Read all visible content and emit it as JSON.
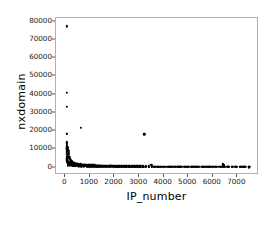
{
  "chart_data": {
    "type": "scatter",
    "title": "",
    "xlabel": "IP_number",
    "ylabel": "nxdomain",
    "xlim": [
      -380,
      7880
    ],
    "ylim": [
      -4000,
      82000
    ],
    "xticks": [
      0,
      1000,
      2000,
      3000,
      4000,
      5000,
      6000,
      7000
    ],
    "xtick_labels": [
      "0",
      "1000",
      "2000",
      "3000",
      "4000",
      "5000",
      "6000",
      "7000"
    ],
    "yticks": [
      0,
      10000,
      20000,
      30000,
      40000,
      50000,
      60000,
      70000,
      80000
    ],
    "ytick_labels": [
      "0",
      "10000",
      "20000",
      "30000",
      "40000",
      "50000",
      "60000",
      "70000",
      "80000"
    ],
    "grid": false,
    "legend": null,
    "marker": "square-dot",
    "marker_color": "#000000",
    "marker_size": 2.4,
    "points": [
      [
        60,
        77500
      ],
      [
        55,
        41000
      ],
      [
        62,
        33200
      ],
      [
        58,
        18700
      ],
      [
        70,
        18500
      ],
      [
        620,
        22000
      ],
      [
        3210,
        18200
      ],
      [
        52,
        13400
      ],
      [
        56,
        11700
      ],
      [
        60,
        10900
      ],
      [
        64,
        10400
      ],
      [
        70,
        10100
      ],
      [
        76,
        9900
      ],
      [
        82,
        9700
      ],
      [
        90,
        9500
      ],
      [
        100,
        9300
      ],
      [
        115,
        9200
      ],
      [
        135,
        9100
      ],
      [
        58,
        8600
      ],
      [
        62,
        8000
      ],
      [
        66,
        7400
      ],
      [
        54,
        5900
      ],
      [
        58,
        5200
      ],
      [
        63,
        4600
      ],
      [
        68,
        4100
      ],
      [
        74,
        3700
      ],
      [
        80,
        3300
      ],
      [
        88,
        3000
      ],
      [
        96,
        2700
      ],
      [
        106,
        2500
      ],
      [
        118,
        2300
      ],
      [
        130,
        2150
      ],
      [
        145,
        2000
      ],
      [
        160,
        1900
      ],
      [
        178,
        1800
      ],
      [
        196,
        1720
      ],
      [
        215,
        1650
      ],
      [
        236,
        1590
      ],
      [
        258,
        1520
      ],
      [
        282,
        1460
      ],
      [
        305,
        1400
      ],
      [
        330,
        1350
      ],
      [
        356,
        1300
      ],
      [
        384,
        1260
      ],
      [
        412,
        1220
      ],
      [
        442,
        1180
      ],
      [
        474,
        1140
      ],
      [
        506,
        1100
      ],
      [
        540,
        1070
      ],
      [
        575,
        1040
      ],
      [
        612,
        1010
      ],
      [
        650,
        980
      ],
      [
        690,
        950
      ],
      [
        732,
        925
      ],
      [
        775,
        900
      ],
      [
        820,
        875
      ],
      [
        866,
        850
      ],
      [
        914,
        830
      ],
      [
        964,
        810
      ],
      [
        1016,
        790
      ],
      [
        1070,
        770
      ],
      [
        1126,
        750
      ],
      [
        1184,
        735
      ],
      [
        1244,
        720
      ],
      [
        1306,
        705
      ],
      [
        1370,
        690
      ],
      [
        1436,
        675
      ],
      [
        1504,
        660
      ],
      [
        1574,
        648
      ],
      [
        1646,
        636
      ],
      [
        1720,
        624
      ],
      [
        1796,
        612
      ],
      [
        1874,
        600
      ],
      [
        1954,
        590
      ],
      [
        2036,
        580
      ],
      [
        2120,
        570
      ],
      [
        2206,
        560
      ],
      [
        2294,
        550
      ],
      [
        2384,
        540
      ],
      [
        2476,
        532
      ],
      [
        2570,
        524
      ],
      [
        2666,
        516
      ],
      [
        2764,
        508
      ],
      [
        2864,
        500
      ],
      [
        2966,
        492
      ],
      [
        3070,
        485
      ],
      [
        3176,
        478
      ],
      [
        3284,
        471
      ],
      [
        3394,
        464
      ],
      [
        3506,
        457
      ],
      [
        3620,
        450
      ],
      [
        3736,
        444
      ],
      [
        3854,
        438
      ],
      [
        3974,
        432
      ],
      [
        4096,
        426
      ],
      [
        4220,
        420
      ],
      [
        4346,
        414
      ],
      [
        4474,
        408
      ],
      [
        4604,
        403
      ],
      [
        4736,
        398
      ],
      [
        4870,
        393
      ],
      [
        5006,
        388
      ],
      [
        5144,
        383
      ],
      [
        5284,
        378
      ],
      [
        5426,
        373
      ],
      [
        5570,
        368
      ],
      [
        5716,
        364
      ],
      [
        5864,
        360
      ],
      [
        6014,
        356
      ],
      [
        6166,
        352
      ],
      [
        6320,
        348
      ],
      [
        6476,
        344
      ],
      [
        6634,
        340
      ],
      [
        6794,
        336
      ],
      [
        6956,
        332
      ],
      [
        7120,
        328
      ],
      [
        7286,
        324
      ],
      [
        7454,
        320
      ],
      [
        120,
        2900
      ],
      [
        155,
        2750
      ],
      [
        190,
        2600
      ],
      [
        228,
        2450
      ],
      [
        268,
        2320
      ],
      [
        310,
        2200
      ],
      [
        354,
        2090
      ],
      [
        400,
        1990
      ],
      [
        448,
        1900
      ],
      [
        498,
        1820
      ],
      [
        550,
        1740
      ],
      [
        604,
        1670
      ],
      [
        660,
        1600
      ],
      [
        718,
        1540
      ],
      [
        778,
        1480
      ],
      [
        840,
        1430
      ],
      [
        904,
        1380
      ],
      [
        970,
        1330
      ],
      [
        1038,
        1285
      ],
      [
        1108,
        1240
      ],
      [
        1180,
        1200
      ],
      [
        1254,
        1160
      ],
      [
        1330,
        1125
      ],
      [
        1408,
        1090
      ],
      [
        1488,
        1055
      ],
      [
        1570,
        1025
      ],
      [
        1654,
        995
      ],
      [
        1740,
        965
      ],
      [
        1828,
        940
      ],
      [
        1918,
        915
      ],
      [
        2010,
        890
      ],
      [
        2104,
        865
      ],
      [
        2200,
        845
      ],
      [
        2298,
        825
      ],
      [
        2398,
        805
      ],
      [
        2500,
        785
      ],
      [
        2604,
        768
      ],
      [
        2710,
        751
      ],
      [
        2818,
        734
      ],
      [
        2928,
        718
      ],
      [
        3040,
        702
      ],
      [
        3154,
        688
      ],
      [
        3270,
        674
      ],
      [
        3388,
        660
      ],
      [
        3508,
        647
      ],
      [
        3630,
        634
      ],
      [
        3754,
        622
      ],
      [
        3880,
        610
      ],
      [
        4008,
        598
      ],
      [
        4138,
        587
      ],
      [
        4270,
        576
      ],
      [
        4404,
        566
      ],
      [
        4540,
        556
      ],
      [
        4678,
        546
      ],
      [
        4818,
        536
      ],
      [
        4960,
        527
      ],
      [
        5104,
        518
      ],
      [
        5250,
        510
      ],
      [
        5398,
        502
      ],
      [
        5548,
        494
      ],
      [
        5700,
        486
      ],
      [
        5854,
        478
      ],
      [
        6010,
        471
      ],
      [
        6168,
        464
      ],
      [
        6328,
        457
      ],
      [
        6490,
        450
      ],
      [
        6654,
        444
      ],
      [
        6820,
        438
      ],
      [
        6988,
        432
      ],
      [
        7158,
        426
      ],
      [
        7330,
        420
      ],
      [
        7480,
        415
      ],
      [
        3480,
        1500
      ],
      [
        3520,
        1350
      ],
      [
        6400,
        1850
      ],
      [
        6430,
        1500
      ],
      [
        6460,
        1250
      ],
      [
        210,
        3400
      ],
      [
        250,
        3100
      ],
      [
        295,
        2850
      ],
      [
        342,
        2620
      ],
      [
        392,
        2420
      ],
      [
        445,
        2250
      ],
      [
        500,
        2100
      ],
      [
        558,
        1960
      ],
      [
        618,
        1840
      ],
      [
        680,
        1730
      ],
      [
        745,
        1630
      ],
      [
        812,
        1545
      ],
      [
        882,
        1465
      ],
      [
        954,
        1395
      ],
      [
        1028,
        1330
      ],
      [
        1104,
        1270
      ],
      [
        1182,
        1215
      ],
      [
        1262,
        1165
      ],
      [
        1344,
        1120
      ],
      [
        1428,
        1078
      ],
      [
        1514,
        1038
      ],
      [
        1602,
        1002
      ],
      [
        1692,
        968
      ],
      [
        1784,
        936
      ],
      [
        1878,
        906
      ],
      [
        1974,
        878
      ],
      [
        2072,
        852
      ],
      [
        2172,
        828
      ],
      [
        2274,
        805
      ],
      [
        2378,
        783
      ],
      [
        2484,
        763
      ],
      [
        2592,
        744
      ],
      [
        2702,
        726
      ],
      [
        2814,
        709
      ],
      [
        2928,
        693
      ],
      [
        3044,
        678
      ],
      [
        3162,
        663
      ],
      [
        3282,
        649
      ],
      [
        3404,
        636
      ],
      [
        3528,
        623
      ],
      [
        3654,
        611
      ],
      [
        3782,
        600
      ],
      [
        3912,
        589
      ],
      [
        4044,
        578
      ],
      [
        4178,
        568
      ],
      [
        4314,
        558
      ],
      [
        4452,
        549
      ],
      [
        4592,
        540
      ],
      [
        4734,
        531
      ],
      [
        4878,
        523
      ],
      [
        5024,
        515
      ],
      [
        5172,
        507
      ],
      [
        5322,
        500
      ],
      [
        5474,
        493
      ],
      [
        5628,
        486
      ],
      [
        5784,
        479
      ],
      [
        5942,
        473
      ],
      [
        6102,
        467
      ],
      [
        6264,
        461
      ],
      [
        6428,
        455
      ],
      [
        6594,
        449
      ],
      [
        6762,
        444
      ],
      [
        6932,
        439
      ],
      [
        7104,
        434
      ],
      [
        7278,
        429
      ],
      [
        7454,
        424
      ],
      [
        100,
        6200
      ],
      [
        105,
        5400
      ],
      [
        112,
        4800
      ],
      [
        66,
        14000
      ],
      [
        72,
        12600
      ],
      [
        78,
        11200
      ],
      [
        86,
        10600
      ],
      [
        140,
        7800
      ],
      [
        148,
        6900
      ],
      [
        165,
        5600
      ],
      [
        182,
        4900
      ],
      [
        205,
        4300
      ],
      [
        232,
        3800
      ],
      [
        262,
        3450
      ],
      [
        90,
        1200
      ],
      [
        175,
        1100
      ],
      [
        260,
        1000
      ],
      [
        350,
        950
      ],
      [
        445,
        900
      ],
      [
        545,
        860
      ],
      [
        650,
        820
      ],
      [
        760,
        790
      ],
      [
        875,
        760
      ],
      [
        995,
        735
      ],
      [
        1120,
        710
      ],
      [
        1250,
        690
      ],
      [
        1385,
        670
      ],
      [
        1525,
        650
      ],
      [
        1670,
        635
      ],
      [
        1820,
        620
      ],
      [
        1975,
        605
      ],
      [
        2135,
        592
      ],
      [
        2300,
        580
      ],
      [
        2470,
        568
      ],
      [
        2645,
        557
      ],
      [
        2825,
        546
      ],
      [
        3010,
        536
      ],
      [
        3200,
        526
      ],
      [
        3395,
        517
      ],
      [
        3595,
        508
      ],
      [
        3800,
        500
      ],
      [
        4010,
        492
      ],
      [
        4225,
        484
      ],
      [
        4445,
        477
      ],
      [
        4670,
        470
      ],
      [
        4900,
        463
      ],
      [
        5135,
        457
      ],
      [
        5375,
        451
      ],
      [
        5620,
        445
      ],
      [
        5870,
        439
      ],
      [
        6125,
        434
      ],
      [
        6385,
        428
      ],
      [
        6650,
        423
      ],
      [
        6920,
        418
      ],
      [
        7195,
        413
      ],
      [
        7470,
        408
      ],
      [
        420,
        1560
      ],
      [
        480,
        1480
      ],
      [
        560,
        1400
      ],
      [
        640,
        1330
      ],
      [
        730,
        1270
      ],
      [
        1300,
        860
      ],
      [
        1450,
        830
      ],
      [
        1600,
        805
      ],
      [
        2800,
        620
      ],
      [
        3050,
        600
      ],
      [
        4600,
        480
      ],
      [
        5200,
        455
      ],
      [
        5800,
        436
      ],
      [
        6600,
        418
      ],
      [
        7250,
        405
      ]
    ]
  }
}
